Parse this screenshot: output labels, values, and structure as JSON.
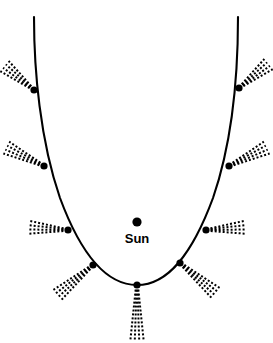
{
  "figure": {
    "name": "comet-orbit-diagram",
    "type": "diagram",
    "background_color": "#ffffff",
    "ink_color": "#000000",
    "width": 273,
    "height": 343
  },
  "sun": {
    "label": "Sun",
    "marker_x": 137,
    "marker_y": 222,
    "marker_radius": 4.6,
    "label_x": 137,
    "label_y": 232
  },
  "orbit": {
    "name": "comet-orbit-path",
    "description": "parabolic comet orbit curve",
    "stroke_width": 2.1,
    "path": "M 34 17 C 34 70, 40 140, 60 198 C 80 252, 105 285, 137 285 C 169 285, 193 252, 213 198 C 233 140, 238 70, 238 17"
  },
  "comet_positions": [
    {
      "id": "position-1",
      "name": "comet-position-upper-left",
      "x": 34,
      "y": 90,
      "tail_angle_deg": 219,
      "tail_length": 38,
      "dot_radius": 3.6
    },
    {
      "id": "position-2",
      "name": "comet-position-midupper-left",
      "x": 44,
      "y": 166,
      "tail_angle_deg": 206,
      "tail_length": 42,
      "dot_radius": 3.6
    },
    {
      "id": "position-3",
      "name": "comet-position-mid-left",
      "x": 68,
      "y": 230,
      "tail_angle_deg": 184,
      "tail_length": 40,
      "dot_radius": 3.6
    },
    {
      "id": "position-4",
      "name": "comet-position-lower-left",
      "x": 93,
      "y": 265,
      "tail_angle_deg": 140,
      "tail_length": 48,
      "dot_radius": 3.6
    },
    {
      "id": "position-5",
      "name": "comet-position-perihelion",
      "x": 137,
      "y": 285,
      "tail_angle_deg": 90,
      "tail_length": 55,
      "dot_radius": 3.6
    },
    {
      "id": "position-6",
      "name": "comet-position-lower-right",
      "x": 180,
      "y": 263,
      "tail_angle_deg": 40,
      "tail_length": 48,
      "dot_radius": 3.6
    },
    {
      "id": "position-7",
      "name": "comet-position-mid-right",
      "x": 206,
      "y": 230,
      "tail_angle_deg": -4,
      "tail_length": 40,
      "dot_radius": 3.6
    },
    {
      "id": "position-8",
      "name": "comet-position-midupper-right",
      "x": 229,
      "y": 166,
      "tail_angle_deg": -26,
      "tail_length": 42,
      "dot_radius": 3.6
    },
    {
      "id": "position-9",
      "name": "comet-position-upper-right",
      "x": 239,
      "y": 88,
      "tail_angle_deg": -39,
      "tail_length": 38,
      "dot_radius": 3.6
    }
  ],
  "tail_style": {
    "description": "dotted-dashed comet tail pointing radially away from the Sun",
    "dash_pattern": "2 2",
    "stroke_width": 2,
    "spread_offsets": [
      -3,
      -1,
      1,
      3
    ]
  },
  "chart_data": {
    "type": "scatter",
    "title": "",
    "xlabel": "",
    "ylabel": "",
    "legend": [],
    "annotations": [
      "Sun"
    ],
    "series": [
      {
        "name": "comet-orbit",
        "points": [
          [
            34,
            90
          ],
          [
            44,
            166
          ],
          [
            68,
            230
          ],
          [
            93,
            265
          ],
          [
            137,
            285
          ],
          [
            180,
            263
          ],
          [
            206,
            230
          ],
          [
            229,
            166
          ],
          [
            239,
            88
          ]
        ]
      },
      {
        "name": "sun",
        "points": [
          [
            137,
            222
          ]
        ]
      }
    ]
  }
}
